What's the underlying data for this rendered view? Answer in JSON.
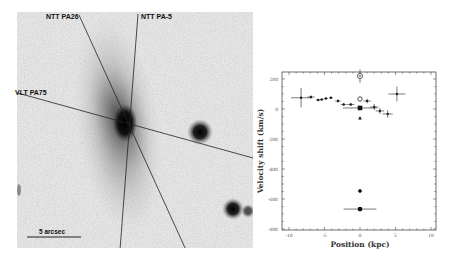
{
  "image_panel": {
    "slit_labels": [
      {
        "label": "NTT PA26",
        "pa": 26
      },
      {
        "label": "NTT PA-5",
        "pa": -5
      },
      {
        "label": "VLT PA75",
        "pa": 75
      }
    ],
    "scale_bar_label": "5 arcsec"
  },
  "chart_data": {
    "type": "scatter",
    "title": "",
    "xlabel": "Position (kpc)",
    "ylabel": "Velocity shift (km/s)",
    "xlim": [
      -11,
      11
    ],
    "ylim": [
      -800,
      250
    ],
    "x_ticks": [
      -10,
      -5,
      0,
      5,
      10
    ],
    "y_ticks": [
      200,
      0,
      -200,
      -400,
      -600,
      -800
    ],
    "grid": false,
    "series": [
      {
        "name": "slit points (crosses)",
        "marker": "plus",
        "points": [
          {
            "x": -8.3,
            "y": 75,
            "xerr": 1.4,
            "yerr": 65
          },
          {
            "x": -6.9,
            "y": 80,
            "xerr": 0.5,
            "yerr": 10
          },
          {
            "x": -5.9,
            "y": 60,
            "xerr": 0.3,
            "yerr": 6
          },
          {
            "x": -5.4,
            "y": 63,
            "xerr": 0.3,
            "yerr": 6
          },
          {
            "x": -4.8,
            "y": 70,
            "xerr": 0.3,
            "yerr": 6
          },
          {
            "x": -4.1,
            "y": 75,
            "xerr": 0.3,
            "yerr": 6
          },
          {
            "x": -3.1,
            "y": 53,
            "xerr": 0.4,
            "yerr": 10
          },
          {
            "x": -2.3,
            "y": 30,
            "xerr": 0.4,
            "yerr": 10
          },
          {
            "x": -1.3,
            "y": 30,
            "xerr": 0.5,
            "yerr": 10
          },
          {
            "x": 1.0,
            "y": 53,
            "xerr": 0.5,
            "yerr": 15
          },
          {
            "x": 2.0,
            "y": 13,
            "xerr": 0.6,
            "yerr": 20
          },
          {
            "x": 2.8,
            "y": -13,
            "xerr": 0.6,
            "yerr": 20
          },
          {
            "x": 3.9,
            "y": -33,
            "xerr": 0.7,
            "yerr": 25
          },
          {
            "x": 5.2,
            "y": 100,
            "xerr": 1.2,
            "yerr": 50
          }
        ]
      },
      {
        "name": "star",
        "marker": "star",
        "points": [
          {
            "x": 0,
            "y": 220,
            "xerr": 0,
            "yerr": 45
          }
        ]
      },
      {
        "name": "open circle",
        "marker": "open-circle",
        "points": [
          {
            "x": 0,
            "y": 67
          }
        ]
      },
      {
        "name": "filled square",
        "marker": "filled-square",
        "points": [
          {
            "x": 0,
            "y": 7,
            "xerr": 2.4
          }
        ]
      },
      {
        "name": "triangle",
        "marker": "triangle",
        "points": [
          {
            "x": 0,
            "y": -60
          }
        ]
      },
      {
        "name": "diamond",
        "marker": "diamond",
        "points": [
          {
            "x": 0,
            "y": -547
          }
        ]
      },
      {
        "name": "filled circle",
        "marker": "filled-circle",
        "points": [
          {
            "x": 0,
            "y": -667,
            "xerr": 2.3
          }
        ]
      }
    ]
  }
}
